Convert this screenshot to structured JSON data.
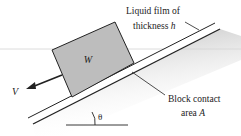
{
  "diagram": {
    "labels": {
      "film_line1": "Liquid film of",
      "film_line2_prefix": "thickness ",
      "film_symbol": "h",
      "contact_line1": "Block contact",
      "contact_line2_prefix": "area ",
      "contact_symbol": "A",
      "weight": "W",
      "velocity": "V",
      "angle": "θ"
    },
    "colors": {
      "block_fill": "#bdbdbd",
      "stroke": "#222222",
      "shadow": "#c8c8c8"
    }
  }
}
